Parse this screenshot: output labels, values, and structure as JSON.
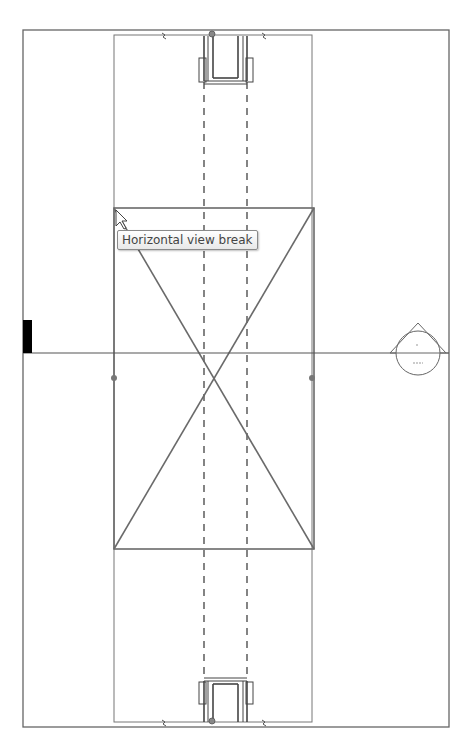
{
  "view": {
    "type": "section-view-canvas",
    "tooltip": "Horizontal view break",
    "level_marker": {
      "label_top": "-",
      "label_bottom": "---"
    }
  },
  "colors": {
    "line": "#555555",
    "frame": "#666666",
    "crop_box": "#6a6a6a",
    "dashed": "#333333",
    "grip": "#777777",
    "marker_black": "#000000"
  }
}
